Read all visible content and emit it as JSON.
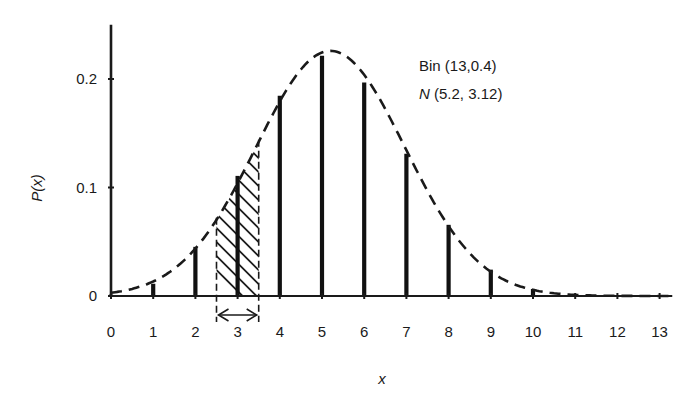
{
  "chart_data": {
    "type": "bar",
    "title": "",
    "xlabel": "x",
    "ylabel": "P(x)",
    "xlim": [
      0,
      13.3
    ],
    "ylim": [
      0,
      0.25
    ],
    "x_ticks": [
      "0",
      "1",
      "2",
      "3",
      "4",
      "5",
      "6",
      "7",
      "8",
      "9",
      "10",
      "11",
      "12",
      "13"
    ],
    "y_ticks": [
      {
        "value": 0,
        "label": "0"
      },
      {
        "value": 0.1,
        "label": "0.1"
      },
      {
        "value": 0.2,
        "label": "0.2"
      }
    ],
    "grid": false,
    "series": [
      {
        "name": "Bin (13,0.4)",
        "kind": "stem",
        "x": [
          0,
          1,
          2,
          3,
          4,
          5,
          6,
          7,
          8,
          9,
          10,
          11,
          12,
          13
        ],
        "values": [
          0.0013,
          0.0113,
          0.0453,
          0.1107,
          0.1845,
          0.2214,
          0.1968,
          0.1312,
          0.0656,
          0.0243,
          0.0065,
          0.0012,
          0.0001,
          0.0
        ]
      },
      {
        "name": "N (5.2, 3.12)",
        "kind": "dashed-curve",
        "mean": 5.2,
        "variance": 3.12
      }
    ],
    "annotations": {
      "legend_line1": "Bin (13,0.4)",
      "legend_line2_italic": "N",
      "legend_line2_rest": " (5.2, 3.12)",
      "legend_position": "top-right",
      "shaded_interval": [
        2.5,
        3.5
      ],
      "shaded_interval_note": "hatched area under normal curve between 2.5 and 3.5 with double-headed arrow"
    }
  }
}
